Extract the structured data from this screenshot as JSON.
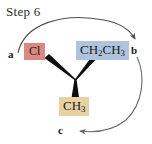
{
  "figure": {
    "title": "Step 6",
    "background": "#ffffff",
    "width": 152,
    "height": 144
  },
  "molecule": {
    "center_label": "stereocenter-carbon",
    "bonds": [
      {
        "name": "bond-to-cl",
        "type": "wedge",
        "from": "center",
        "to": "Cl"
      },
      {
        "name": "bond-to-ethyl",
        "type": "wedge",
        "from": "center",
        "to": "CH2CH3"
      },
      {
        "name": "bond-to-methyl",
        "type": "wedge",
        "from": "center",
        "to": "CH3"
      }
    ],
    "substituents": [
      {
        "id": "cl",
        "text": "Cl",
        "html": "Cl",
        "color": "#d9897f",
        "priority_letter": "a"
      },
      {
        "id": "ethyl",
        "text": "CH2CH3",
        "html": "CH<sub>2</sub>CH<sub>3</sub>",
        "color": "#aec3dd",
        "priority_letter": "b"
      },
      {
        "id": "methyl",
        "text": "CH3",
        "html": "CH<sub>3</sub>",
        "color": "#e7d0a2",
        "priority_letter": "c"
      }
    ]
  },
  "priority_labels": {
    "a": "a",
    "b": "b",
    "c": "c"
  },
  "arrows": [
    {
      "name": "arrow-a-to-b",
      "from": "a",
      "to": "b",
      "direction": "clockwise-over-top",
      "color": "#4f4f52"
    },
    {
      "name": "arrow-b-to-c",
      "from": "b",
      "to": "c",
      "direction": "clockwise-around-right",
      "color": "#6a6a6e"
    }
  ],
  "colors": {
    "chlorine_chip": "#d9897f",
    "ethyl_chip": "#aec3dd",
    "methyl_chip": "#e7d0a2",
    "bond": "#0d0d0d",
    "arrow": "#55555a",
    "text": "#1a1a1a"
  }
}
